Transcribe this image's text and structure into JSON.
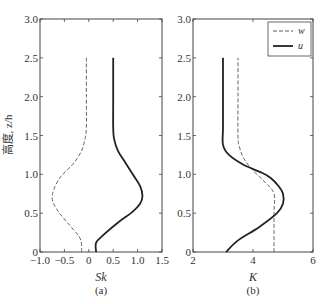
{
  "chart_data": [
    {
      "type": "line",
      "panel_label": "(a)",
      "title": "",
      "xlabel": "Sk",
      "ylabel": "高度, z/h",
      "xlim": [
        -1.0,
        1.5
      ],
      "ylim": [
        0,
        3.0
      ],
      "xticks": [
        "-1.0",
        "-0.5",
        "0",
        "0.5",
        "1.0",
        "1.5"
      ],
      "yticks": [
        "0",
        "0.5",
        "1.0",
        "1.5",
        "2.0",
        "2.5",
        "3.0"
      ],
      "grid": false,
      "series": [
        {
          "name": "w",
          "style": "dashed",
          "points": [
            [
              -0.15,
              0.0
            ],
            [
              -0.15,
              0.1
            ],
            [
              -0.2,
              0.2
            ],
            [
              -0.4,
              0.35
            ],
            [
              -0.6,
              0.5
            ],
            [
              -0.72,
              0.62
            ],
            [
              -0.75,
              0.7
            ],
            [
              -0.72,
              0.8
            ],
            [
              -0.6,
              0.95
            ],
            [
              -0.45,
              1.05
            ],
            [
              -0.3,
              1.15
            ],
            [
              -0.15,
              1.3
            ],
            [
              -0.08,
              1.45
            ],
            [
              -0.05,
              1.6
            ],
            [
              -0.05,
              2.0
            ],
            [
              -0.05,
              2.5
            ]
          ]
        },
        {
          "name": "u",
          "style": "solid",
          "points": [
            [
              0.15,
              0.0
            ],
            [
              0.15,
              0.12
            ],
            [
              0.3,
              0.22
            ],
            [
              0.6,
              0.38
            ],
            [
              0.9,
              0.52
            ],
            [
              1.05,
              0.62
            ],
            [
              1.1,
              0.72
            ],
            [
              1.05,
              0.85
            ],
            [
              0.9,
              1.0
            ],
            [
              0.75,
              1.15
            ],
            [
              0.6,
              1.3
            ],
            [
              0.52,
              1.45
            ],
            [
              0.5,
              1.6
            ],
            [
              0.5,
              2.0
            ],
            [
              0.5,
              2.5
            ]
          ]
        }
      ]
    },
    {
      "type": "line",
      "panel_label": "(b)",
      "title": "",
      "xlabel": "K",
      "ylabel": "",
      "xlim": [
        2,
        6
      ],
      "ylim": [
        0,
        3.0
      ],
      "xticks": [
        "2",
        "4",
        "6"
      ],
      "yticks": [
        "0",
        "0.5",
        "1.0",
        "1.5",
        "2.0",
        "2.5",
        "3.0"
      ],
      "grid": false,
      "legend": {
        "position": "upper right",
        "entries": [
          "w",
          "u"
        ]
      },
      "series": [
        {
          "name": "w",
          "style": "dashed",
          "points": [
            [
              4.7,
              0.0
            ],
            [
              4.7,
              0.5
            ],
            [
              4.7,
              0.75
            ],
            [
              4.4,
              0.9
            ],
            [
              4.0,
              1.05
            ],
            [
              3.7,
              1.2
            ],
            [
              3.55,
              1.35
            ],
            [
              3.5,
              1.5
            ],
            [
              3.5,
              2.0
            ],
            [
              3.5,
              2.5
            ]
          ]
        },
        {
          "name": "u",
          "style": "solid",
          "points": [
            [
              3.1,
              0.0
            ],
            [
              3.5,
              0.15
            ],
            [
              4.2,
              0.32
            ],
            [
              4.8,
              0.5
            ],
            [
              5.0,
              0.62
            ],
            [
              5.0,
              0.75
            ],
            [
              4.85,
              0.85
            ],
            [
              4.6,
              0.95
            ],
            [
              4.3,
              1.02
            ],
            [
              3.7,
              1.12
            ],
            [
              3.2,
              1.25
            ],
            [
              3.0,
              1.38
            ],
            [
              3.0,
              1.6
            ],
            [
              3.0,
              2.0
            ],
            [
              3.0,
              2.5
            ]
          ]
        }
      ]
    }
  ],
  "colors": {
    "line": "#222222",
    "axis": "#444444",
    "background": "#ffffff"
  }
}
